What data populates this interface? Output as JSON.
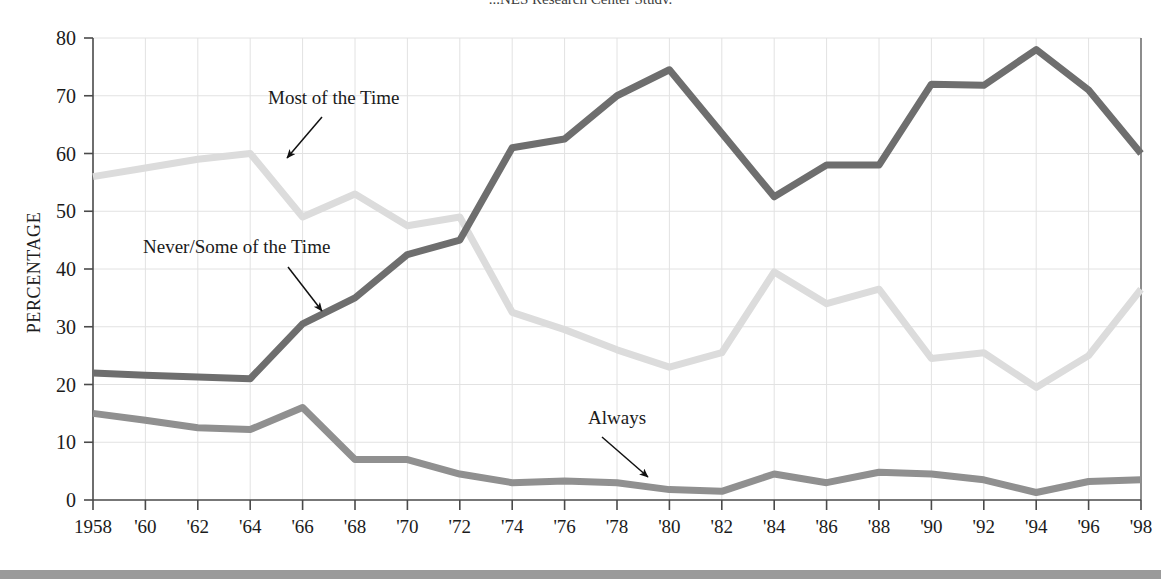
{
  "chart_data": {
    "type": "line",
    "title": "...NES Research Center Study.",
    "xlabel": "",
    "ylabel": "PERCENTAGE",
    "ylim": [
      0,
      80
    ],
    "ytick_step": 10,
    "yticks": [
      "0",
      "10",
      "20",
      "30",
      "40",
      "50",
      "60",
      "70",
      "80"
    ],
    "grid": true,
    "legend_position": "inline-annotations",
    "x": [
      1958,
      1960,
      1962,
      1964,
      1966,
      1968,
      1970,
      1972,
      1974,
      1976,
      1978,
      1980,
      1982,
      1984,
      1986,
      1988,
      1990,
      1992,
      1994,
      1996,
      1998
    ],
    "categories": [
      "1958",
      "'60",
      "'62",
      "'64",
      "'66",
      "'68",
      "'70",
      "'72",
      "'74",
      "'76",
      "'78",
      "'80",
      "'82",
      "'84",
      "'86",
      "'88",
      "'90",
      "'92",
      "'94",
      "'96",
      "'98"
    ],
    "series": [
      {
        "name": "Never/Some of the Time",
        "color": "#6e6e6e",
        "values": [
          22,
          21.6,
          21.3,
          21,
          30.5,
          35,
          42.5,
          45,
          61,
          62.5,
          70,
          74.5,
          63.5,
          52.5,
          58,
          58,
          72,
          71.8,
          78,
          71,
          60
        ]
      },
      {
        "name": "Most of the Time",
        "color": "#dcdcdc",
        "values": [
          56,
          57.5,
          59,
          60,
          49,
          53,
          47.5,
          49,
          32.5,
          29.5,
          26,
          23,
          25.5,
          39.5,
          34,
          36.5,
          24.5,
          25.5,
          19.5,
          25,
          36.5
        ]
      },
      {
        "name": "Always",
        "color": "#909090",
        "values": [
          15,
          13.8,
          12.5,
          12.2,
          16,
          7,
          7,
          4.5,
          3,
          3.3,
          3,
          1.8,
          1.5,
          4.5,
          3,
          4.8,
          4.5,
          3.5,
          1.3,
          3.2,
          3.5
        ]
      }
    ],
    "annotations": [
      {
        "label": "Most of the Time",
        "series": "Most of the Time",
        "text_x": 268,
        "text_y": 104,
        "arrow_x1": 322,
        "arrow_y1": 117,
        "arrow_x2": 287,
        "arrow_y2": 158
      },
      {
        "label": "Never/Some of the Time",
        "series": "Never/Some of the Time",
        "text_x": 143,
        "text_y": 253,
        "arrow_x1": 288,
        "arrow_y1": 267,
        "arrow_x2": 322,
        "arrow_y2": 311
      },
      {
        "label": "Always",
        "series": "Always",
        "text_x": 588,
        "text_y": 424,
        "arrow_x1": 602,
        "arrow_y1": 437,
        "arrow_x2": 648,
        "arrow_y2": 477
      }
    ]
  },
  "colors": {
    "series_dark": "#6e6e6e",
    "series_light": "#dcdcdc",
    "series_mid": "#909090",
    "grid": "#e2e2e2",
    "axis": "#4a4a4a",
    "text": "#1b1b1b",
    "footer_rule": "#9a9a9a",
    "background": "#ffffff"
  }
}
